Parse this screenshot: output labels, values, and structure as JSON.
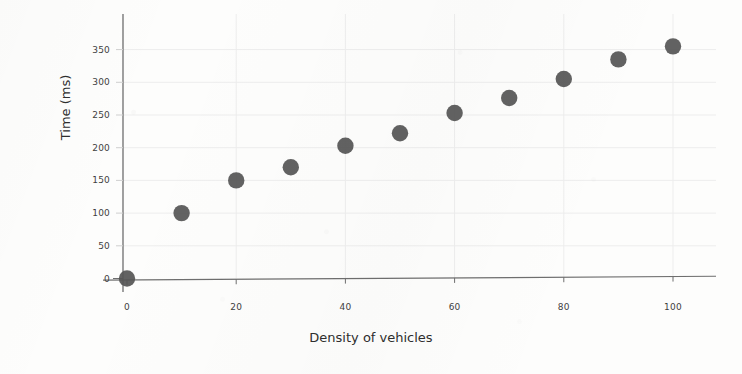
{
  "chart_data": {
    "type": "scatter",
    "title": "",
    "xlabel": "Density of vehicles",
    "ylabel": "Time (ms)",
    "x": [
      0,
      10,
      20,
      30,
      40,
      50,
      60,
      70,
      80,
      90,
      100
    ],
    "values": [
      0,
      100,
      150,
      170,
      203,
      222,
      253,
      276,
      305,
      335,
      355
    ],
    "series": [
      {
        "name": "Time vs density",
        "x": [
          0,
          10,
          20,
          30,
          40,
          50,
          60,
          70,
          80,
          90,
          100
        ],
        "values": [
          0,
          100,
          150,
          170,
          203,
          222,
          253,
          276,
          305,
          335,
          355
        ]
      }
    ],
    "xlim": [
      0,
      108
    ],
    "ylim": [
      0,
      380
    ],
    "xticks": [
      0,
      20,
      40,
      60,
      80,
      100
    ],
    "yticks": [
      0,
      50,
      100,
      150,
      200,
      250,
      300,
      350
    ],
    "xtick_labels": [
      "0",
      "20",
      "40",
      "60",
      "80",
      "100"
    ],
    "ytick_labels": [
      "0",
      "50",
      "100",
      "150",
      "200",
      "250",
      "300",
      "350"
    ],
    "grid": true,
    "legend": false,
    "legend_position": "none",
    "marker_color": "#555555",
    "axis_color": "#6e6e6e",
    "grid_color": "#ededed",
    "background_color": "#fdfdfc"
  }
}
